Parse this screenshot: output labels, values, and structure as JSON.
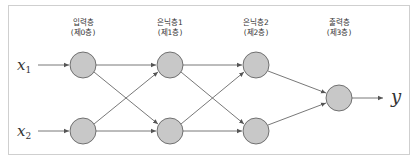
{
  "diagram": {
    "type": "neural-network",
    "layers": [
      {
        "name": "입력층",
        "index_label": "(제0층)",
        "node_count": 2
      },
      {
        "name": "은닉층1",
        "index_label": "(제1층)",
        "node_count": 2
      },
      {
        "name": "은닉층2",
        "index_label": "(제2층)",
        "node_count": 2
      },
      {
        "name": "출력층",
        "index_label": "(제3층)",
        "node_count": 1
      }
    ],
    "inputs": [
      {
        "symbol": "x",
        "subscript": "1"
      },
      {
        "symbol": "x",
        "subscript": "2"
      }
    ],
    "output": {
      "symbol": "y"
    },
    "colors": {
      "node_fill": "#c8c8c8",
      "node_stroke": "#555555",
      "edge": "#555555",
      "border": "#cfcfcf"
    }
  }
}
